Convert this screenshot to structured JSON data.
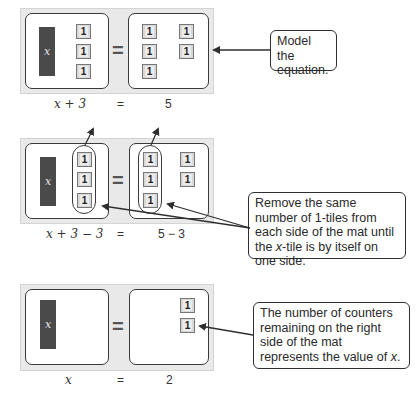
{
  "panels": [
    {
      "id": "model",
      "left_mat": {
        "x_tile": "x",
        "ones": [
          "1",
          "1",
          "1"
        ]
      },
      "equals": "=",
      "right_mat": {
        "ones": [
          "1",
          "1",
          "1",
          "1",
          "1"
        ]
      },
      "expression": {
        "left": "x + 3",
        "equals": "=",
        "right": "5"
      },
      "callout": "Model the equation."
    },
    {
      "id": "remove",
      "left_mat": {
        "x_tile": "x",
        "ones": [
          "1",
          "1",
          "1"
        ]
      },
      "equals": "=",
      "right_mat": {
        "ones": [
          "1",
          "1",
          "1",
          "1",
          "1"
        ]
      },
      "expression": {
        "left": "x + 3 − 3",
        "equals": "=",
        "right": "5 − 3"
      },
      "callout": "Remove the same number of 1-tiles from each side of the mat until the x-tile is by itself on one side."
    },
    {
      "id": "solution",
      "left_mat": {
        "x_tile": "x"
      },
      "equals": "=",
      "right_mat": {
        "ones": [
          "1",
          "1"
        ]
      },
      "expression": {
        "left": "x",
        "equals": "=",
        "right": "2"
      },
      "callout": "The number of counters remaining on the right side of the mat represents the value of x."
    }
  ],
  "colors": {
    "frame": "#e9e9e9",
    "x_tile": "#4a4a4a",
    "one_tile": "#d8d8d8",
    "border": "#3a3a3a"
  }
}
